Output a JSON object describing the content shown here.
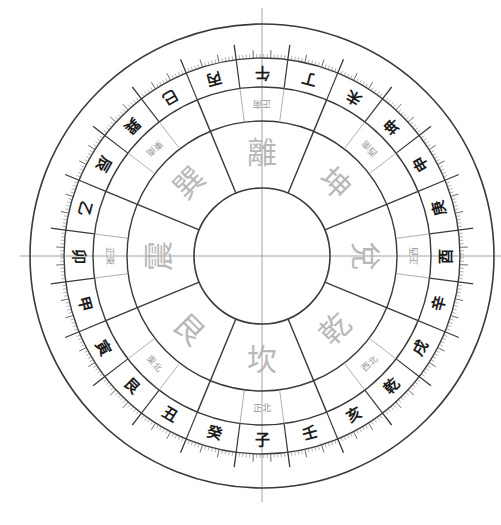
{
  "diagram": {
    "type": "luopan-compass",
    "orientation": "south-up",
    "center": [
      262,
      256
    ],
    "radii": {
      "outer": 232,
      "tick_inner": 198,
      "mountain_inner": 169,
      "label_inner": 135,
      "center_circle": 68
    },
    "colors": {
      "line_dark": "#3a3a3a",
      "line_light": "#9a9a9a",
      "mountain_text": "#1a1a1a",
      "label_text": "#9a9a9a",
      "trigram_text": "#b8b8b8",
      "axis": "#8a8a8a"
    },
    "mountains": [
      "午",
      "丁",
      "未",
      "坤",
      "申",
      "庚",
      "酉",
      "辛",
      "戌",
      "乾",
      "亥",
      "壬",
      "子",
      "癸",
      "丑",
      "艮",
      "寅",
      "甲",
      "卯",
      "乙",
      "辰",
      "巽",
      "巳",
      "丙"
    ],
    "direction_labels": [
      "正南",
      "西南",
      "正西",
      "西北",
      "正北",
      "東北",
      "正東",
      "東南"
    ],
    "trigrams": [
      "離",
      "坤",
      "兌",
      "乾",
      "坎",
      "艮",
      "震",
      "巽"
    ]
  },
  "caption": ""
}
